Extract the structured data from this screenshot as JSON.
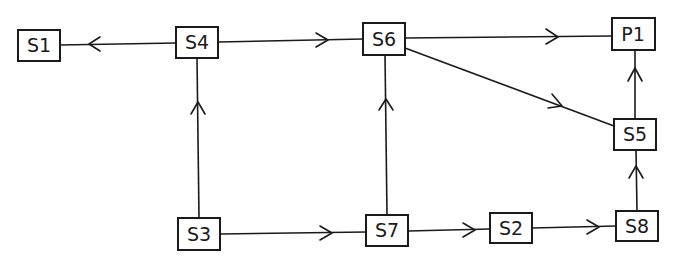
{
  "diagram": {
    "type": "directed-graph",
    "colors": {
      "stroke": "#1a1a1a",
      "background": "#ffffff"
    },
    "nodes": [
      {
        "id": "S1",
        "label": "S1",
        "x": 18,
        "y": 30,
        "w": 42,
        "h": 31
      },
      {
        "id": "S4",
        "label": "S4",
        "x": 176,
        "y": 27,
        "w": 42,
        "h": 31
      },
      {
        "id": "S6",
        "label": "S6",
        "x": 363,
        "y": 23,
        "w": 42,
        "h": 32
      },
      {
        "id": "P1",
        "label": "P1",
        "x": 612,
        "y": 18,
        "w": 43,
        "h": 32
      },
      {
        "id": "S5",
        "label": "S5",
        "x": 614,
        "y": 119,
        "w": 42,
        "h": 31
      },
      {
        "id": "S3",
        "label": "S3",
        "x": 178,
        "y": 218,
        "w": 42,
        "h": 32
      },
      {
        "id": "S7",
        "label": "S7",
        "x": 366,
        "y": 215,
        "w": 42,
        "h": 31
      },
      {
        "id": "S2",
        "label": "S2",
        "x": 490,
        "y": 213,
        "w": 42,
        "h": 30
      },
      {
        "id": "S8",
        "label": "S8",
        "x": 616,
        "y": 211,
        "w": 42,
        "h": 30
      }
    ],
    "edges": [
      {
        "from": "S4",
        "to": "S1"
      },
      {
        "from": "S4",
        "to": "S6"
      },
      {
        "from": "S6",
        "to": "P1"
      },
      {
        "from": "S6",
        "to": "S5"
      },
      {
        "from": "S5",
        "to": "P1"
      },
      {
        "from": "S3",
        "to": "S4"
      },
      {
        "from": "S7",
        "to": "S6"
      },
      {
        "from": "S8",
        "to": "S5"
      },
      {
        "from": "S3",
        "to": "S7"
      },
      {
        "from": "S7",
        "to": "S2"
      },
      {
        "from": "S2",
        "to": "S8"
      }
    ]
  }
}
